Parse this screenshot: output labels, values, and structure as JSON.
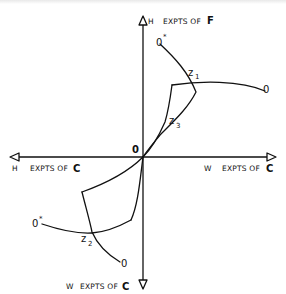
{
  "diagram": {
    "origin_label": "0",
    "axes": {
      "up": {
        "prefix": "H",
        "text": "EXPTS OF",
        "letter": "F"
      },
      "left": {
        "prefix": "H",
        "text": "EXPTS OF",
        "letter": "C"
      },
      "right": {
        "prefix": "W",
        "text": "EXPTS OF",
        "letter": "C"
      },
      "down": {
        "prefix": "W",
        "text": "EXPTS OF",
        "letter": "C"
      }
    },
    "points": {
      "upper": {
        "o_star": "0",
        "o_star_sup": "*",
        "z1": "z",
        "z1_sub": "1",
        "o": "0",
        "z3": "z",
        "z3_sub": "3"
      },
      "lower": {
        "o_star": "0",
        "o_star_sup": "*",
        "z2": "z",
        "z2_sub": "2",
        "o": "0"
      }
    },
    "colors": {
      "ink": "#111111",
      "background": "#ffffff"
    }
  }
}
